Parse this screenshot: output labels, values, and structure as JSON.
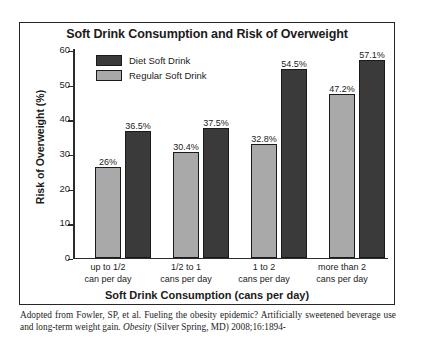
{
  "chart_data": {
    "type": "bar",
    "title": "Soft Drink Consumption and Risk of Overweight",
    "xlabel": "Soft Drink Consumption (cans per day)",
    "ylabel": "Risk of Overweight (%)",
    "ylim": [
      0,
      60
    ],
    "yticks": [
      0,
      10,
      20,
      30,
      40,
      50,
      60
    ],
    "ytick_labels": [
      "0",
      "10",
      "20",
      "30",
      "40",
      "50",
      "60"
    ],
    "grid": false,
    "legend_position": "top-left-inside",
    "categories": [
      "up to 1/2\ncan per day",
      "1/2 to 1\ncans per day",
      "1 to 2\ncans per day",
      "more than 2\ncans per day"
    ],
    "category_lines": [
      [
        "up to 1/2",
        "can per day"
      ],
      [
        "1/2 to 1",
        "cans per day"
      ],
      [
        "1 to 2",
        "cans per day"
      ],
      [
        "more than 2",
        "cans per day"
      ]
    ],
    "series": [
      {
        "name": "Regular Soft Drink",
        "color": "#a9a9a9",
        "values": [
          26,
          30.4,
          32.8,
          47.2
        ],
        "labels": [
          "26%",
          "30.4%",
          "32.8%",
          "47.2%"
        ]
      },
      {
        "name": "Diet Soft Drink",
        "color": "#3a3a3a",
        "values": [
          36.5,
          37.5,
          54.5,
          57.1
        ],
        "labels": [
          "36.5%",
          "37.5%",
          "54.5%",
          "57.1%"
        ]
      }
    ]
  },
  "legend": {
    "items": [
      {
        "label": "Diet Soft Drink",
        "swatch": "#3a3a3a"
      },
      {
        "label": "Regular Soft Drink",
        "swatch": "#a9a9a9"
      }
    ]
  },
  "footer": {
    "line1_pre": "Adopted from Fowler, SP, et al. Fueling  the obesity epidemic? Artificially sweetened",
    "line2_pre": "beverage use and long-term weight gain. ",
    "line2_italic": "Obesity",
    "line2_post": " (Silver Spring, MD) 2008;16:1894-"
  }
}
